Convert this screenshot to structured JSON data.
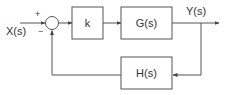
{
  "diagram": {
    "input_label": "X(s)",
    "output_label": "Y(s)",
    "plus_sign": "+",
    "minus_sign": "−",
    "blocks": [
      {
        "id": "k",
        "label": "k"
      },
      {
        "id": "G",
        "label": "G(s)"
      },
      {
        "id": "H",
        "label": "H(s)"
      }
    ],
    "colors": {
      "line": "#555555",
      "text": "#333333"
    }
  }
}
